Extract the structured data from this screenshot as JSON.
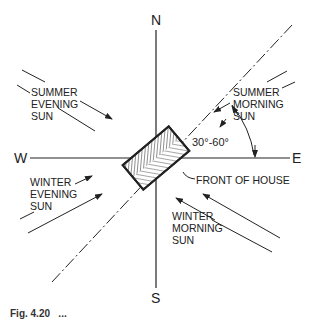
{
  "diagram": {
    "compass": {
      "north": "N",
      "south": "S",
      "east": "E",
      "west": "W"
    },
    "labels": {
      "summer_evening": "SUMMER\nEVENING\nSUN",
      "summer_morning": "SUMMER\nMORNING\nSUN",
      "winter_evening": "WINTER\nEVENING\nSUN",
      "winter_morning": "WINTER\nMORNING\nSUN",
      "angle": "30°-60°",
      "front_of_house": "FRONT OF HOUSE"
    },
    "caption": "Fig. 4.20   ...",
    "colors": {
      "ink": "#222222",
      "background": "#ffffff"
    }
  }
}
